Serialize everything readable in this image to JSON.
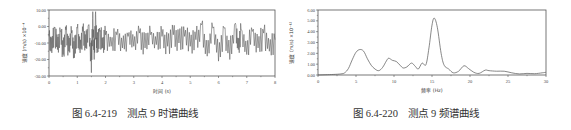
{
  "figures": [
    {
      "caption": "图 6.4-219    测点 9 时谱曲线",
      "xlabel": "时间 (s)",
      "ylabel": "速度 (m/s) ×10⁻⁴",
      "yticks": [
        "10.00",
        "0.00",
        "-10.00",
        "-20.00",
        "-30.00"
      ],
      "xticks": [
        "0",
        "1",
        "2",
        "3",
        "4",
        "5",
        "6",
        "7",
        "8"
      ]
    },
    {
      "caption": "图 6.4-220    测点 9 频谱曲线",
      "xlabel": "频率 (Hz)",
      "ylabel": "速度 (m/s) ×10⁻¹²",
      "yticks": [
        "6.00",
        "5.00",
        "4.00",
        "3.00",
        "2.00",
        "1.00",
        "0.00"
      ],
      "xticks": [
        "0",
        "5",
        "10",
        "15",
        "20",
        "25",
        "30"
      ]
    }
  ],
  "chart_data": [
    {
      "type": "line",
      "title": "测点 9 时谱曲线",
      "xlabel": "时间 (s)",
      "ylabel": "速度 (m/s) ×10⁻⁴",
      "xlim": [
        0,
        8
      ],
      "ylim": [
        -30,
        10
      ],
      "grid": false,
      "x": [
        0,
        0.1,
        0.2,
        0.3,
        0.4,
        0.5,
        0.6,
        0.7,
        0.8,
        0.9,
        1.0,
        1.1,
        1.2,
        1.3,
        1.4,
        1.5,
        1.55,
        1.6,
        1.65,
        1.7,
        1.8,
        1.9,
        2.0,
        2.2,
        2.4,
        2.6,
        2.8,
        3.0,
        3.2,
        3.4,
        3.6,
        3.8,
        4.0,
        4.2,
        4.4,
        4.6,
        4.8,
        5.0,
        5.2,
        5.4,
        5.6,
        5.8,
        6.0,
        6.2,
        6.4,
        6.6,
        6.7,
        6.8,
        7.0,
        7.2,
        7.4,
        7.6,
        7.8,
        8.0
      ],
      "y": [
        -6,
        -16,
        -1,
        -14,
        -3,
        -17,
        -2,
        -15,
        -4,
        -19,
        -1,
        -16,
        -3,
        -13,
        1,
        -28,
        9,
        -20,
        9,
        -16,
        -3,
        -13,
        -5,
        -12,
        -5,
        -13,
        -6,
        -12,
        -4,
        -13,
        -5,
        -11,
        -6,
        -12,
        -5,
        -10,
        -6,
        -12,
        -8,
        1,
        -18,
        -1,
        -21,
        -1,
        -20,
        2,
        -14,
        -2,
        -17,
        -3,
        -13,
        -4,
        -15,
        -8
      ],
      "notes": "dense vibration waveform oscillating around about -8, maximum about +9 near t≈1.6 s, minimum about -28 near t≈1.55 s"
    },
    {
      "type": "line",
      "title": "测点 9 频谱曲线",
      "xlabel": "频率 (Hz)",
      "ylabel": "速度 (m/s) ×10⁻¹²",
      "xlim": [
        0,
        30
      ],
      "ylim": [
        0,
        6
      ],
      "grid": false,
      "x": [
        0,
        2,
        3,
        3.5,
        4,
        4.5,
        5,
        5.5,
        6,
        6.5,
        7,
        7.5,
        8,
        8.5,
        9,
        9.3,
        9.8,
        10.3,
        10.8,
        11.2,
        11.7,
        12.3,
        12.8,
        13.2,
        13.7,
        14.2,
        14.6,
        15.0,
        15.3,
        15.7,
        16.2,
        16.6,
        17.2,
        17.8,
        18.5,
        19.2,
        19.8,
        20.5,
        21.2,
        22.0,
        22.5,
        23.5,
        24.5,
        25.5,
        26.5,
        27.5,
        28.5,
        29.5,
        30
      ],
      "y": [
        0.0,
        0.05,
        0.1,
        0.2,
        0.6,
        1.4,
        2.1,
        2.35,
        2.2,
        1.5,
        0.9,
        0.55,
        0.4,
        0.7,
        1.3,
        1.55,
        1.35,
        1.25,
        0.9,
        0.65,
        0.75,
        1.1,
        0.8,
        0.55,
        1.1,
        0.95,
        2.5,
        4.6,
        5.25,
        4.4,
        2.0,
        0.9,
        0.55,
        0.2,
        0.35,
        0.85,
        0.6,
        0.25,
        0.15,
        0.45,
        0.4,
        0.35,
        0.35,
        0.2,
        0.1,
        0.15,
        0.12,
        0.2,
        0.25
      ],
      "notes": "dominant peak ≈5.25 at ≈15.3 Hz; secondary peak ≈2.35 at ≈5.5 Hz"
    }
  ]
}
